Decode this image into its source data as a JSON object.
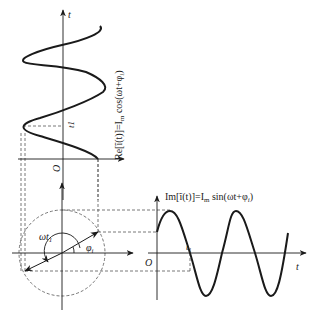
{
  "diagram": {
    "type": "phasor-projection",
    "colors": {
      "stroke": "#1a1a1a",
      "dashed": "#555555",
      "background": "#ffffff"
    },
    "top_plot": {
      "axis_label": "t",
      "origin_label": "O",
      "time_marker": "t1",
      "curve_label": "Re[ĩ(t)]=I_m cos(ωt+φ_i)",
      "curve_label_text": "Re[ĩ(t)]=I",
      "curve_label_sub": "m",
      "curve_label_tail": " cos(ωt+φ",
      "curve_label_sub2": "i",
      "curve_label_end": ")"
    },
    "phasor": {
      "angle_label_1": "ωt",
      "angle_label_1_sub": "1",
      "angle_label_2": "φ",
      "angle_label_2_sub": "i"
    },
    "right_plot": {
      "axis_label": "t",
      "origin_label": "O",
      "time_marker": "t",
      "time_marker_sub": "1",
      "curve_label_text": "Im[ĩ(t)]=I",
      "curve_label_sub": "m",
      "curve_label_tail": " sin(ωt+φ",
      "curve_label_sub2": "i",
      "curve_label_end": ")"
    }
  }
}
